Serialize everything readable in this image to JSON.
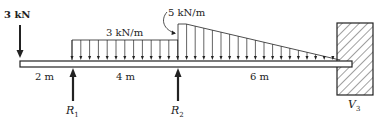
{
  "diagram": {
    "point_load": {
      "label": "3 kN"
    },
    "uniform_load": {
      "label": "3 kN/m"
    },
    "triangular_load": {
      "label": "5 kN/m"
    },
    "spans": [
      {
        "label": "2 m"
      },
      {
        "label": "4 m"
      },
      {
        "label": "6 m"
      }
    ],
    "reactions": [
      {
        "label": "R",
        "sub": "1"
      },
      {
        "label": "R",
        "sub": "2"
      },
      {
        "label": "V",
        "sub": "3"
      }
    ],
    "colors": {
      "ink": "#222222",
      "background": "#ffffff"
    }
  }
}
